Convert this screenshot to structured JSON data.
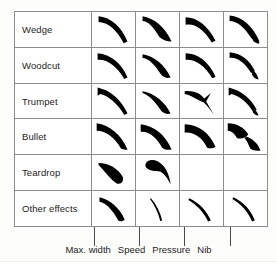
{
  "figure": {
    "background_color": "#fdfdfc",
    "ink_color": "#000000",
    "grid_line_color": "#8d8d8d"
  },
  "table": {
    "row_header_label": "",
    "rows": [
      {
        "label": "Wedge",
        "cells": [
          {
            "column": "Max. width",
            "shape": "wedge-stroke-max-width",
            "empty": false
          },
          {
            "column": "Speed",
            "shape": "wedge-stroke-speed",
            "empty": false
          },
          {
            "column": "Pressure",
            "shape": "wedge-stroke-pressure",
            "empty": false
          },
          {
            "column": "Nib",
            "shape": "wedge-stroke-nib",
            "empty": false
          }
        ]
      },
      {
        "label": "Woodcut",
        "cells": [
          {
            "column": "Max. width",
            "shape": "woodcut-stroke-max-width",
            "empty": false
          },
          {
            "column": "Speed",
            "shape": "woodcut-stroke-speed",
            "empty": false
          },
          {
            "column": "Pressure",
            "shape": "woodcut-stroke-pressure",
            "empty": false
          },
          {
            "column": "Nib",
            "shape": "woodcut-stroke-nib",
            "empty": false
          }
        ]
      },
      {
        "label": "Trumpet",
        "cells": [
          {
            "column": "Max. width",
            "shape": "trumpet-stroke-max-width",
            "empty": false
          },
          {
            "column": "Speed",
            "shape": "trumpet-stroke-speed",
            "empty": false
          },
          {
            "column": "Pressure",
            "shape": "trumpet-stroke-pressure",
            "empty": false
          },
          {
            "column": "Nib",
            "shape": "trumpet-stroke-nib",
            "empty": false
          }
        ]
      },
      {
        "label": "Bullet",
        "cells": [
          {
            "column": "Max. width",
            "shape": "bullet-stroke-max-width",
            "empty": false
          },
          {
            "column": "Speed",
            "shape": "bullet-stroke-speed",
            "empty": false
          },
          {
            "column": "Pressure",
            "shape": "bullet-stroke-pressure",
            "empty": false
          },
          {
            "column": "Nib",
            "shape": "bullet-stroke-nib",
            "empty": false
          }
        ]
      },
      {
        "label": "Teardrop",
        "cells": [
          {
            "column": "Max. width",
            "shape": "teardrop-stroke-max-width",
            "empty": false
          },
          {
            "column": "Speed",
            "shape": "teardrop-stroke-speed",
            "empty": false
          },
          {
            "column": "Pressure",
            "shape": "",
            "empty": true
          },
          {
            "column": "Nib",
            "shape": "",
            "empty": true
          }
        ]
      },
      {
        "label": "Other effects",
        "cells": [
          {
            "column": "Max. width",
            "shape": "other-stroke-max-width",
            "empty": false
          },
          {
            "column": "Speed",
            "shape": "other-stroke-speed",
            "empty": false
          },
          {
            "column": "Pressure",
            "shape": "other-stroke-pressure",
            "empty": false
          },
          {
            "column": "Nib",
            "shape": "other-stroke-nib",
            "empty": false
          }
        ]
      }
    ]
  },
  "columns": [
    {
      "label": "Max. width",
      "leader_x": 80
    },
    {
      "label": "Speed",
      "leader_x": 125
    },
    {
      "label": "Pressure",
      "leader_x": 170
    },
    {
      "label": "Nib",
      "leader_x": 216
    }
  ]
}
